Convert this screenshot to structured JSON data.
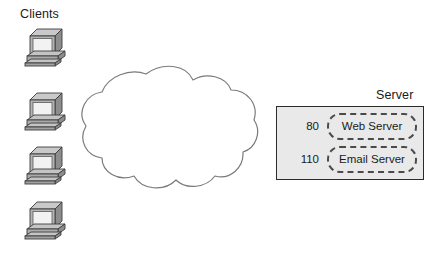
{
  "diagram": {
    "title_clients": "Clients",
    "title_server": "Server",
    "clients": [
      {
        "icon": "desktop-computer-icon",
        "x": 24,
        "y": 26
      },
      {
        "icon": "desktop-computer-icon",
        "x": 24,
        "y": 90
      },
      {
        "icon": "desktop-computer-icon",
        "x": 24,
        "y": 144
      },
      {
        "icon": "desktop-computer-icon",
        "x": 24,
        "y": 199
      }
    ],
    "network": {
      "icon": "network-cloud-icon",
      "outline_color": "#808080",
      "fill_color": "#ffffff"
    },
    "server": {
      "fill_color": "#e9e9e9",
      "border_color": "#2b2b2b",
      "services": [
        {
          "port": "80",
          "name": "Web Server"
        },
        {
          "port": "110",
          "name": "Email Server"
        }
      ]
    },
    "colors": {
      "text": "#1a1a1a",
      "icon_light": "#d4d4d4",
      "icon_mid": "#a8a8a8",
      "icon_dark": "#6e6e6e",
      "icon_outline": "#3c3c3c",
      "dashed_border": "#4a4a4a"
    }
  }
}
